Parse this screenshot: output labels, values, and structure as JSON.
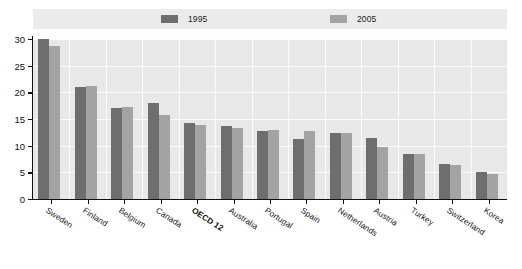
{
  "chart_data": {
    "type": "bar",
    "title": "",
    "subtitle": "",
    "xlabel": "",
    "ylabel": "",
    "ylim": [
      0,
      30
    ],
    "yticks": [
      0,
      5,
      10,
      15,
      20,
      25,
      30
    ],
    "grid": true,
    "legend_position": "top",
    "categories": [
      "Sweden",
      "Finland",
      "Belgium",
      "Canada",
      "OECD 12",
      "Australia",
      "Portugal",
      "Spain",
      "Netherlands",
      "Austria",
      "Turkey",
      "Switzerland",
      "Korea"
    ],
    "highlight_category": "OECD 12",
    "series": [
      {
        "name": "1995",
        "color": "#6e6e6e",
        "values": [
          30.0,
          21.0,
          17.0,
          18.0,
          14.2,
          13.7,
          12.7,
          11.2,
          12.4,
          11.4,
          8.4,
          6.5,
          5.0
        ]
      },
      {
        "name": "2005",
        "color": "#a3a3a3",
        "values": [
          28.7,
          21.2,
          17.2,
          15.7,
          13.8,
          13.3,
          13.0,
          12.8,
          12.4,
          9.8,
          8.4,
          6.4,
          4.6
        ]
      }
    ]
  },
  "legend": {
    "entries": [
      {
        "label": "1995",
        "color": "#6e6e6e"
      },
      {
        "label": "2005",
        "color": "#a3a3a3"
      }
    ]
  },
  "axis": {
    "y_tick_labels": [
      "30",
      "25",
      "20",
      "15",
      "10",
      "5",
      "0"
    ]
  }
}
